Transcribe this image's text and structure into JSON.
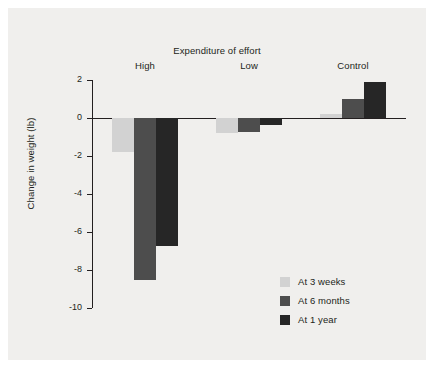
{
  "chart_data": {
    "type": "bar",
    "title": "Expenditure of effort",
    "xlabel": "",
    "ylabel": "Change in weight (lb)",
    "categories": [
      "High",
      "Low",
      "Control"
    ],
    "series": [
      {
        "name": "At 3 weeks",
        "color": "#d2d2d2",
        "values": [
          -1.8,
          -0.8,
          0.2
        ]
      },
      {
        "name": "At 6 months",
        "color": "#4d4d4d",
        "values": [
          -8.55,
          -0.75,
          1.0
        ]
      },
      {
        "name": "At 1 year",
        "color": "#262626",
        "values": [
          -6.75,
          -0.35,
          1.9
        ]
      }
    ],
    "ylim": [
      -10,
      2
    ],
    "yticks": [
      2,
      0,
      -2,
      -4,
      -6,
      -8,
      -10
    ],
    "ytick_labels": [
      "2",
      "0",
      "-2",
      "-4",
      "-6",
      "-8",
      "-10"
    ],
    "grid": false,
    "legend_position": "bottom-right",
    "background_color": "#f0efed",
    "axis_color": "#231f20"
  }
}
